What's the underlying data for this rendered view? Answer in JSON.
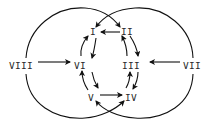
{
  "diagram": {
    "type": "directed-graph",
    "nodes": [
      {
        "id": "I",
        "label": "I"
      },
      {
        "id": "II",
        "label": "II"
      },
      {
        "id": "III",
        "label": "III"
      },
      {
        "id": "IV",
        "label": "IV"
      },
      {
        "id": "V",
        "label": "V"
      },
      {
        "id": "VI",
        "label": "VI"
      },
      {
        "id": "VII",
        "label": "VII"
      },
      {
        "id": "VIII",
        "label": "VIII"
      }
    ],
    "edges": [
      {
        "from": "II",
        "to": "I"
      },
      {
        "from": "V",
        "to": "IV"
      },
      {
        "from": "VIII",
        "to": "VI"
      },
      {
        "from": "VII",
        "to": "III"
      },
      {
        "from": "I",
        "to": "VI"
      },
      {
        "from": "VI",
        "to": "I"
      },
      {
        "from": "II",
        "to": "III"
      },
      {
        "from": "III",
        "to": "II"
      },
      {
        "from": "VI",
        "to": "V"
      },
      {
        "from": "V",
        "to": "VI"
      },
      {
        "from": "III",
        "to": "IV"
      },
      {
        "from": "IV",
        "to": "III"
      },
      {
        "from": "VIII",
        "to": "II",
        "via": "left-circle-top"
      },
      {
        "from": "VII",
        "to": "I",
        "via": "right-circle-top"
      },
      {
        "from": "VIII",
        "to": "IV",
        "via": "left-circle-bottom"
      },
      {
        "from": "VII",
        "to": "V",
        "via": "right-circle-bottom"
      }
    ],
    "colors": {
      "stroke": "#111111",
      "text": "#2a2a2a",
      "background": "#ffffff"
    }
  }
}
